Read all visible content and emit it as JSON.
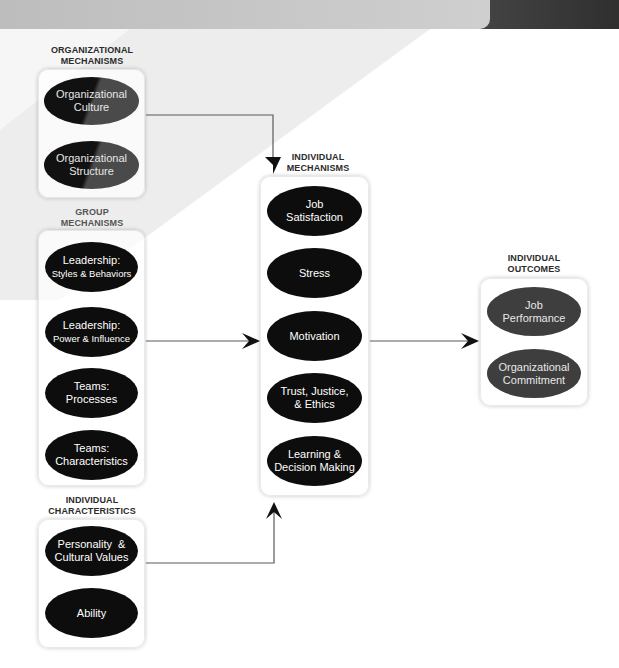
{
  "colors": {
    "node_black": "#0d0d0d",
    "node_gray": "#3e3e3e",
    "band_gray": "#e6e6e6",
    "topbar_light": "#c4c4c4",
    "topbar_dark": "#3a3a3a",
    "arrow": "#555555",
    "title_text": "#2b2b2b"
  },
  "groups": {
    "organizational": {
      "title_line1": "ORGANIZATIONAL",
      "title_line2": "MECHANISMS",
      "nodes": [
        {
          "line1": "Organizational",
          "line2": "Culture"
        },
        {
          "line1": "Organizational",
          "line2": "Structure"
        }
      ]
    },
    "group": {
      "title_line1": "GROUP",
      "title_line2": "MECHANISMS",
      "nodes": [
        {
          "line1": "Leadership:",
          "line2": "Styles & Behaviors"
        },
        {
          "line1": "Leadership:",
          "line2": "Power & Influence"
        },
        {
          "line1": "Teams:",
          "line2": "Processes"
        },
        {
          "line1": "Teams:",
          "line2": "Characteristics"
        }
      ]
    },
    "individual_characteristics": {
      "title_line1": "INDIVIDUAL",
      "title_line2": "CHARACTERISTICS",
      "nodes": [
        {
          "line1": "Personality  &",
          "line2": "Cultural Values"
        },
        {
          "line1": "Ability",
          "line2": ""
        }
      ]
    },
    "individual_mechanisms": {
      "title_line1": "INDIVIDUAL",
      "title_line2": "MECHANISMS",
      "nodes": [
        {
          "line1": "Job",
          "line2": "Satisfaction"
        },
        {
          "line1": "Stress",
          "line2": ""
        },
        {
          "line1": "Motivation",
          "line2": ""
        },
        {
          "line1": "Trust, Justice,",
          "line2": "& Ethics"
        },
        {
          "line1": "Learning &",
          "line2": "Decision Making"
        }
      ]
    },
    "individual_outcomes": {
      "title_line1": "INDIVIDUAL",
      "title_line2": "OUTCOMES",
      "nodes": [
        {
          "line1": "Job",
          "line2": "Performance"
        },
        {
          "line1": "Organizational",
          "line2": "Commitment"
        }
      ]
    }
  },
  "connections": [
    {
      "from": "organizational",
      "to": "individual_mechanisms",
      "direction": "down"
    },
    {
      "from": "group",
      "to": "individual_mechanisms",
      "direction": "right"
    },
    {
      "from": "individual_characteristics",
      "to": "individual_mechanisms",
      "direction": "up"
    },
    {
      "from": "individual_mechanisms",
      "to": "individual_outcomes",
      "direction": "right"
    }
  ]
}
